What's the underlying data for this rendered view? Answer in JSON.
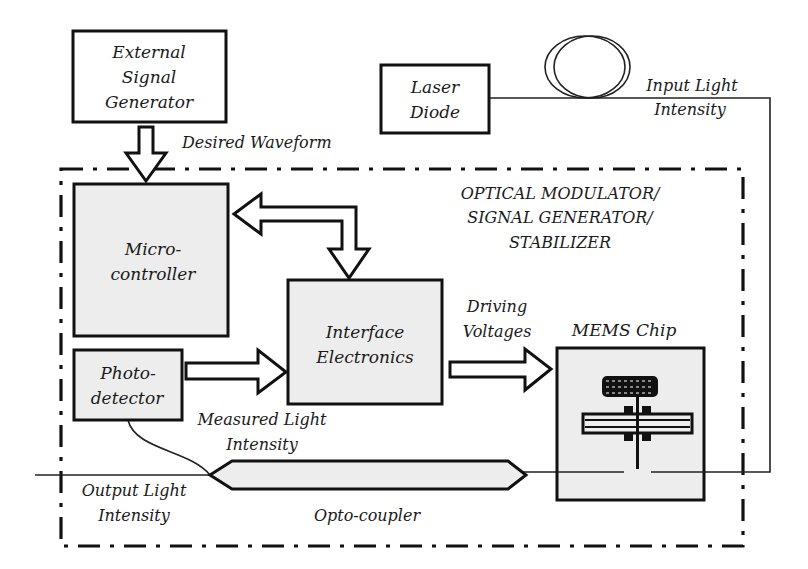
{
  "diagram": {
    "blocks": {
      "external_signal_generator": {
        "line1": "External",
        "line2": "Signal",
        "line3": "Generator"
      },
      "laser_diode": {
        "line1": "Laser",
        "line2": "Diode"
      },
      "microcontroller": {
        "line1": "Micro-",
        "line2": "controller"
      },
      "interface_electronics": {
        "line1": "Interface",
        "line2": "Electronics"
      },
      "photodetector": {
        "line1": "Photo-",
        "line2": "detector"
      },
      "mems_chip": {
        "label": "MEMS Chip"
      }
    },
    "labels": {
      "desired_waveform": "Desired Waveform",
      "input_light_line1": "Input Light",
      "input_light_line2": "Intensity",
      "system_line1": "OPTICAL MODULATOR/",
      "system_line2": "SIGNAL GENERATOR/",
      "system_line3": "STABILIZER",
      "driving_line1": "Driving",
      "driving_line2": "Voltages",
      "measured_line1": "Measured Light",
      "measured_line2": "Intensity",
      "output_line1": "Output Light",
      "output_line2": "Intensity",
      "optocoupler": "Opto-coupler"
    },
    "colors": {
      "block_fill": "#ededed",
      "stroke": "#111111",
      "background": "#ffffff"
    }
  }
}
